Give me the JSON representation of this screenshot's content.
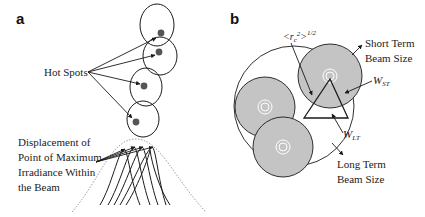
{
  "figure": {
    "panel_a": {
      "label": "a",
      "hot_spots_label": "Hot Spots",
      "displacement_label_lines": [
        "Displacement of",
        "Point of Maximum",
        "Irradiance Within",
        "the Beam"
      ]
    },
    "panel_b": {
      "label": "b",
      "rc_symbol": "<r",
      "rc_sub": "c",
      "rc_sup": "2",
      "rc_close": ">",
      "rc_exp": "1/2",
      "short_term_lines": [
        "Short Term",
        "Beam Size"
      ],
      "long_term_lines": [
        "Long Term",
        "Beam Size"
      ],
      "w_st_main": "W",
      "w_st_sub": "ST",
      "w_lt_main": "W",
      "w_lt_sub": "LT"
    },
    "colors": {
      "line": "#1a1a1a",
      "beam_fill": "#c4c4c4",
      "hot_spot": "#555555",
      "dotted": "#888888"
    }
  }
}
